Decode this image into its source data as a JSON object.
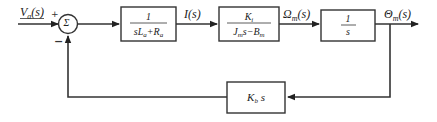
{
  "diagram": {
    "type": "block-diagram",
    "title": "",
    "input_label": "Va(s)",
    "summing_junction": {
      "symbol": "Σ",
      "plus_sign": "+",
      "minus_sign": "−"
    },
    "blocks": [
      {
        "id": "armature",
        "numerator": "1",
        "denominator": "sLa+Ra"
      },
      {
        "id": "torque",
        "numerator": "Ki",
        "denominator": "Jms−Bm"
      },
      {
        "id": "integrator",
        "numerator": "1",
        "denominator": "s"
      },
      {
        "id": "back-emf",
        "expression": "Kbs"
      }
    ],
    "signals": [
      {
        "id": "current",
        "label": "I(s)"
      },
      {
        "id": "speed",
        "label": "Ωm(s)"
      },
      {
        "id": "position",
        "label": "Θm(s)"
      }
    ]
  }
}
